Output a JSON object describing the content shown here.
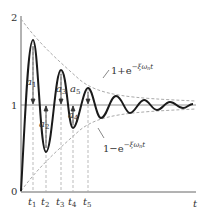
{
  "diagram": {
    "type": "damped oscillation step response",
    "axes": {
      "y_ticks": [
        "0",
        "1",
        "2"
      ],
      "x_label": "t"
    },
    "time_marks": [
      "t1",
      "t2",
      "t3",
      "t4",
      "t5"
    ],
    "time_mark_labels": {
      "base": "t",
      "subs": [
        "1",
        "2",
        "3",
        "4",
        "5"
      ]
    },
    "amplitude_labels": {
      "base": "a",
      "subs": [
        "1",
        "2",
        "3",
        "4",
        "5"
      ]
    },
    "envelopes": {
      "upper": {
        "prefix": "1+e",
        "exponent": "−ξω",
        "exp_sub": "n",
        "exp_tail": "t"
      },
      "lower": {
        "prefix": "1−e",
        "exponent": "−ξω",
        "exp_sub": "n",
        "exp_tail": "t"
      }
    },
    "colors": {
      "curve": "#1a1a1a",
      "axis": "#555555",
      "dashed": "#999999"
    }
  }
}
